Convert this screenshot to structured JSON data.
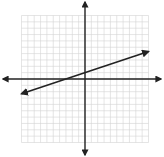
{
  "chart_data": {
    "type": "line",
    "title": "",
    "xlabel": "",
    "ylabel": "",
    "xlim": [
      -10,
      10
    ],
    "ylim": [
      -10,
      10
    ],
    "grid": true,
    "grid_step": 1,
    "axes_arrows": true,
    "series": [
      {
        "name": "line",
        "equation": "y = (1/3)x + 1",
        "slope": 0.3333,
        "intercept": 1,
        "x": [
          -10,
          10
        ],
        "y": [
          -2.333,
          4.333
        ],
        "arrows_both_ends": true,
        "color": "#222222"
      }
    ],
    "x_intercept": -3,
    "y_intercept": 1
  },
  "colors": {
    "grid": "#d4d4d4",
    "axis": "#222222",
    "background": "#ffffff"
  }
}
